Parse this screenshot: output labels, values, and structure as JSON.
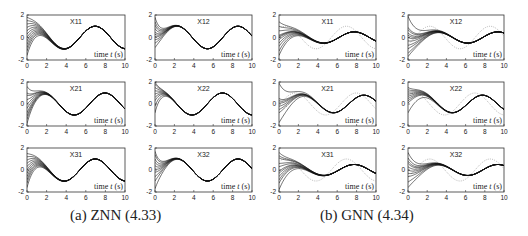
{
  "figure": {
    "captions": [
      {
        "id": "a",
        "text": "(a)  ZNN (4.33)",
        "x": 70
      },
      {
        "id": "b",
        "text": "(b)  GNN (4.34)",
        "x": 320
      }
    ]
  },
  "chart_data": {
    "type": "line",
    "common": {
      "xlabel": "time t (s)",
      "xlim": [
        0,
        10
      ],
      "ylim": [
        -2,
        2
      ],
      "xticks": [
        0,
        2,
        4,
        6,
        8,
        10
      ],
      "yticks": [
        -2,
        0,
        2
      ],
      "grid": false
    },
    "groups": [
      {
        "caption": "(a)  ZNN (4.33)",
        "panels": [
          {
            "title": "X11",
            "theory": {
              "amp": 1.0,
              "freq": 1.0,
              "phase": 0.9
            },
            "conv_time": 4.5,
            "initial": [
              1.8,
              1.5,
              1.2,
              0.9,
              0.6,
              0.3,
              0.0,
              -0.3,
              -0.6,
              -0.9,
              -1.2,
              -1.6
            ]
          },
          {
            "title": "X12",
            "theory": {
              "amp": 1.0,
              "freq": 1.0,
              "phase": -0.7
            },
            "conv_time": 3.0,
            "initial": [
              1.8,
              1.4,
              1.1,
              0.8,
              0.5,
              0.3,
              0.1,
              -0.2,
              -0.5,
              -0.9
            ]
          },
          {
            "title": "X21",
            "theory": {
              "amp": 1.0,
              "freq": 1.0,
              "phase": -0.1
            },
            "conv_time": 3.2,
            "initial": [
              1.6,
              1.0,
              0.8,
              0.4,
              0.0,
              -0.4,
              -0.8,
              -1.1,
              -1.4,
              -1.8
            ]
          },
          {
            "title": "X22",
            "theory": {
              "amp": 1.0,
              "freq": 1.0,
              "phase": 0.9
            },
            "conv_time": 2.5,
            "initial": [
              2.0,
              1.8,
              1.5,
              1.2,
              0.9,
              0.6,
              0.3,
              -0.2,
              -0.8
            ]
          },
          {
            "title": "X31",
            "theory": {
              "amp": 1.0,
              "freq": 1.0,
              "phase": 0.9
            },
            "conv_time": 4.0,
            "initial": [
              1.5,
              1.2,
              0.9,
              0.6,
              0.3,
              0.0,
              -0.3,
              -0.6,
              -0.9,
              -1.2,
              -1.6
            ]
          },
          {
            "title": "X32",
            "theory": {
              "amp": 1.0,
              "freq": 1.0,
              "phase": -0.7
            },
            "conv_time": 3.0,
            "initial": [
              1.7,
              1.4,
              1.0,
              0.7,
              0.4,
              0.1,
              -0.2,
              -0.6,
              -1.0,
              -1.7
            ]
          }
        ]
      },
      {
        "caption": "(b)  GNN (4.34)",
        "panels": [
          {
            "title": "X11",
            "theory": {
              "amp": 1.0,
              "freq": 1.0,
              "phase": 0.9
            },
            "lag": {
              "amp": 0.5,
              "shift": 0.8
            },
            "initial": [
              1.4,
              1.0,
              0.6,
              0.2,
              0.1,
              0.0,
              -0.2,
              -0.5,
              -0.8,
              -1.2,
              -1.6
            ]
          },
          {
            "title": "X12",
            "theory": {
              "amp": 1.0,
              "freq": 1.0,
              "phase": -0.7
            },
            "lag": {
              "amp": 0.5,
              "shift": 0.8
            },
            "initial": [
              1.9,
              0.9,
              0.7,
              0.4,
              0.2,
              0.0,
              -0.3,
              -0.7,
              -1.0,
              -1.4,
              -1.7
            ]
          },
          {
            "title": "X21",
            "theory": {
              "amp": 1.0,
              "freq": 1.0,
              "phase": -0.1
            },
            "lag": {
              "amp": 0.8,
              "shift": 0.8
            },
            "initial": [
              1.9,
              0.5,
              0.3,
              0.1,
              -0.2,
              -0.5,
              -0.8,
              -1.7
            ]
          },
          {
            "title": "X22",
            "theory": {
              "amp": 1.0,
              "freq": 1.0,
              "phase": 0.9
            },
            "lag": {
              "amp": 0.8,
              "shift": 0.8
            },
            "initial": [
              1.5,
              1.3,
              1.1,
              0.9,
              0.7,
              0.5,
              0.3,
              0.1,
              -0.8
            ]
          },
          {
            "title": "X31",
            "theory": {
              "amp": 1.0,
              "freq": 1.0,
              "phase": 0.9
            },
            "lag": {
              "amp": 0.5,
              "shift": 0.8
            },
            "initial": [
              1.6,
              1.3,
              1.1,
              0.6,
              0.3,
              -0.1,
              -0.3,
              -0.6,
              -0.9,
              -1.2,
              -1.8
            ]
          },
          {
            "title": "X32",
            "theory": {
              "amp": 1.0,
              "freq": 1.0,
              "phase": -0.7
            },
            "lag": {
              "amp": 0.5,
              "shift": 0.8
            },
            "initial": [
              1.6,
              1.1,
              0.8,
              0.6,
              0.3,
              0.0,
              -0.3,
              -0.6,
              -1.1,
              -1.6
            ]
          }
        ]
      }
    ],
    "legend": null,
    "colors": {
      "trajectory": "#111111",
      "theory_dotted": "#9a9a9a",
      "frame": "#333333",
      "text": "#222222"
    }
  },
  "layout": {
    "columns_x": [
      [
        27,
        125
      ],
      [
        155,
        252
      ],
      [
        279,
        376
      ],
      [
        408,
        504
      ]
    ],
    "rows_y": [
      [
        15,
        60
      ],
      [
        82,
        126
      ],
      [
        148,
        192
      ]
    ]
  }
}
